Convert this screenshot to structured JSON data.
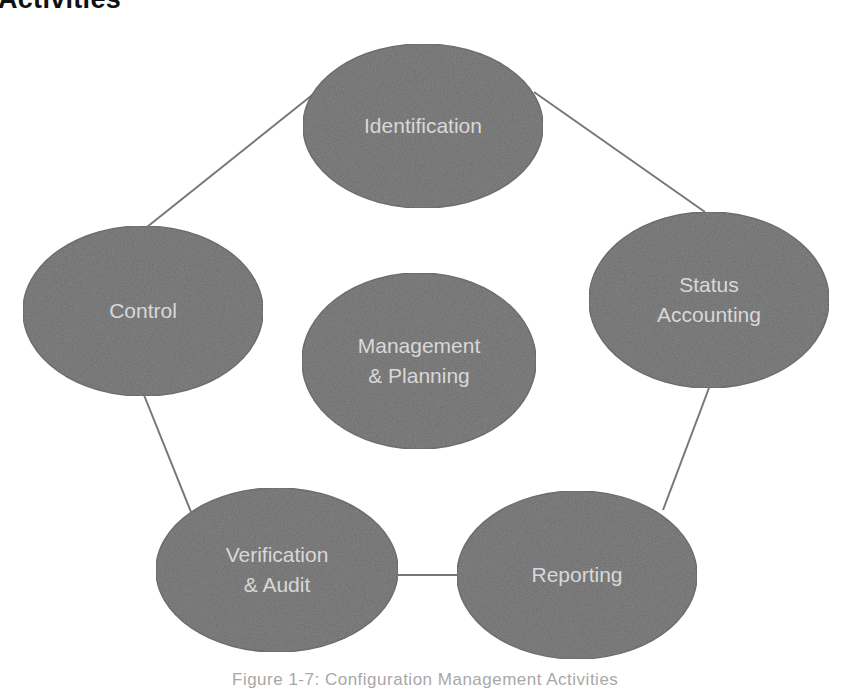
{
  "page": {
    "heading": "Activities"
  },
  "diagram": {
    "colors": {
      "node_fill": "#6a6a6a",
      "node_edge": "#5a5a5a",
      "text": "#d8d8d8",
      "connector": "#777777",
      "background": "#ffffff"
    },
    "nodes": [
      {
        "id": "identification",
        "lines": [
          "Identification"
        ],
        "cx": 423,
        "cy": 126,
        "rx": 120,
        "ry": 82
      },
      {
        "id": "control",
        "lines": [
          "Control"
        ],
        "cx": 143,
        "cy": 311,
        "rx": 120,
        "ry": 85
      },
      {
        "id": "status-accounting",
        "lines": [
          "Status",
          "Accounting"
        ],
        "cx": 709,
        "cy": 300,
        "rx": 120,
        "ry": 88
      },
      {
        "id": "management-planning",
        "lines": [
          "Management",
          "& Planning"
        ],
        "cx": 419,
        "cy": 361,
        "rx": 117,
        "ry": 88
      },
      {
        "id": "verification-audit",
        "lines": [
          "Verification",
          "& Audit"
        ],
        "cx": 277,
        "cy": 570,
        "rx": 121,
        "ry": 82
      },
      {
        "id": "reporting",
        "lines": [
          "Reporting"
        ],
        "cx": 577,
        "cy": 575,
        "rx": 120,
        "ry": 84
      }
    ],
    "edges": [
      {
        "from": "identification",
        "to": "control",
        "x1": 316,
        "y1": 92,
        "x2": 147,
        "y2": 227
      },
      {
        "from": "identification",
        "to": "status-accounting",
        "x1": 534,
        "y1": 92,
        "x2": 705,
        "y2": 212
      },
      {
        "from": "control",
        "to": "verification-audit",
        "x1": 144,
        "y1": 395,
        "x2": 191,
        "y2": 512
      },
      {
        "from": "status-accounting",
        "to": "reporting",
        "x1": 709,
        "y1": 388,
        "x2": 663,
        "y2": 510
      },
      {
        "from": "verification-audit",
        "to": "reporting",
        "x1": 397,
        "y1": 575,
        "x2": 458,
        "y2": 575
      }
    ]
  },
  "caption": "Figure 1-7: Configuration Management Activities"
}
